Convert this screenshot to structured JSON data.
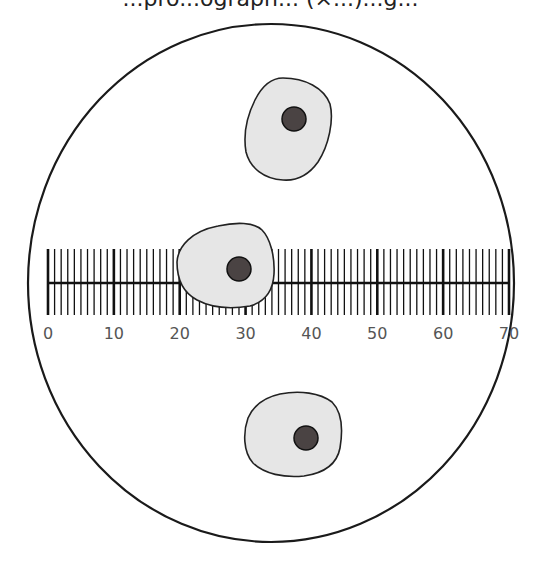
{
  "caption": {
    "text": "...pro...ograph... (×...)...g..."
  },
  "field_of_view": {
    "stroke": "#1a1a1a",
    "fill": "#ffffff",
    "cx": 271,
    "cy": 283,
    "rx": 243,
    "ry": 259
  },
  "scale": {
    "name": "eyepiece graticule",
    "min": 0,
    "max": 70,
    "minor_step": 1,
    "major_step": 10,
    "x_start": 48,
    "x_end": 509,
    "tick_top": 249,
    "tick_bottom": 315,
    "axis_y": 283,
    "labels": [
      "0",
      "10",
      "20",
      "30",
      "40",
      "50",
      "60",
      "70"
    ],
    "label_color": "#555555"
  },
  "cells": [
    {
      "name": "top-cell",
      "cytoplasm_fill": "#e6e6e6",
      "nucleus_fill": "#4a4343",
      "nucleus": {
        "cx": 294,
        "cy": 119,
        "r": 12
      }
    },
    {
      "name": "middle-cell",
      "cytoplasm_fill": "#e6e6e6",
      "nucleus_fill": "#4a4343",
      "nucleus": {
        "cx": 239,
        "cy": 269,
        "r": 12
      }
    },
    {
      "name": "bottom-cell",
      "cytoplasm_fill": "#e6e6e6",
      "nucleus_fill": "#4a4343",
      "nucleus": {
        "cx": 306,
        "cy": 438,
        "r": 12
      }
    }
  ]
}
